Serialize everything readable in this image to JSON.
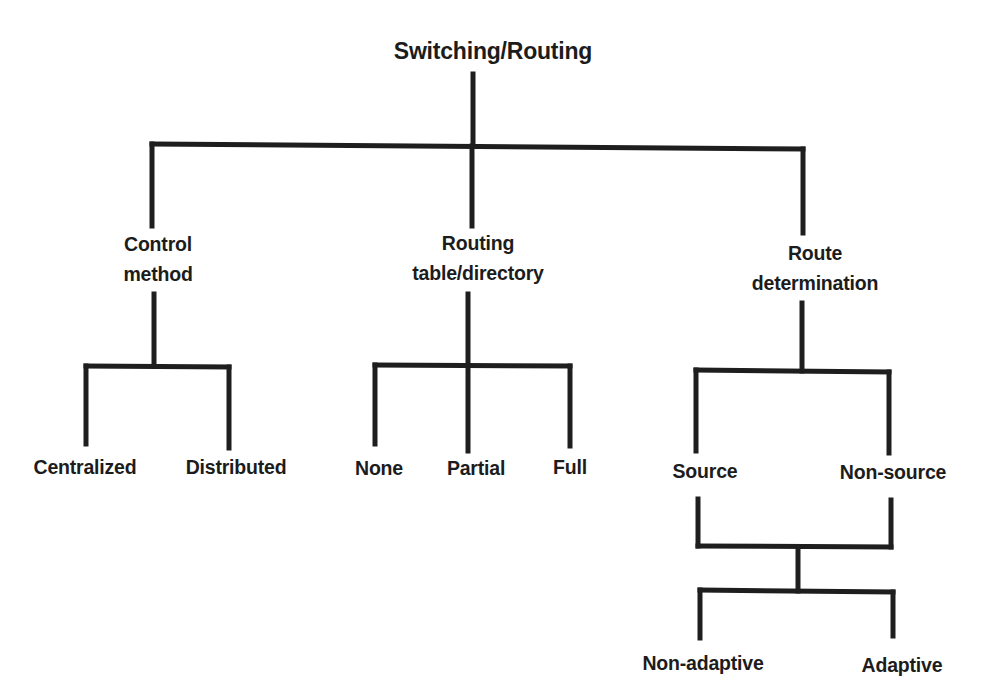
{
  "diagram": {
    "type": "tree",
    "root": {
      "id": "switching-routing",
      "label": "Switching/Routing"
    },
    "nodes": {
      "control_method": {
        "label_lines": [
          "Control",
          "method"
        ],
        "children": [
          "Centralized",
          "Distributed"
        ]
      },
      "routing_table": {
        "label_lines": [
          "Routing",
          "table/directory"
        ],
        "children": [
          "None",
          "Partial",
          "Full"
        ]
      },
      "route_determination": {
        "label_lines": [
          "Route",
          "determination"
        ],
        "children": [
          "Source",
          "Non-source"
        ],
        "merged_children": [
          "Non-adaptive",
          "Adaptive"
        ]
      }
    },
    "leaves": {
      "centralized": "Centralized",
      "distributed": "Distributed",
      "none": "None",
      "partial": "Partial",
      "full": "Full",
      "source": "Source",
      "non_source": "Non-source",
      "non_adaptive": "Non-adaptive",
      "adaptive": "Adaptive"
    },
    "edges": [
      [
        "Switching/Routing",
        "Control method"
      ],
      [
        "Switching/Routing",
        "Routing table/directory"
      ],
      [
        "Switching/Routing",
        "Route determination"
      ],
      [
        "Control method",
        "Centralized"
      ],
      [
        "Control method",
        "Distributed"
      ],
      [
        "Routing table/directory",
        "None"
      ],
      [
        "Routing table/directory",
        "Partial"
      ],
      [
        "Routing table/directory",
        "Full"
      ],
      [
        "Route determination",
        "Source"
      ],
      [
        "Route determination",
        "Non-source"
      ],
      [
        "Source",
        "Non-adaptive"
      ],
      [
        "Source",
        "Adaptive"
      ],
      [
        "Non-source",
        "Non-adaptive"
      ],
      [
        "Non-source",
        "Adaptive"
      ]
    ],
    "colors": {
      "line": "#1e1e1e",
      "text": "#1c1c1c",
      "background": "#ffffff"
    }
  }
}
